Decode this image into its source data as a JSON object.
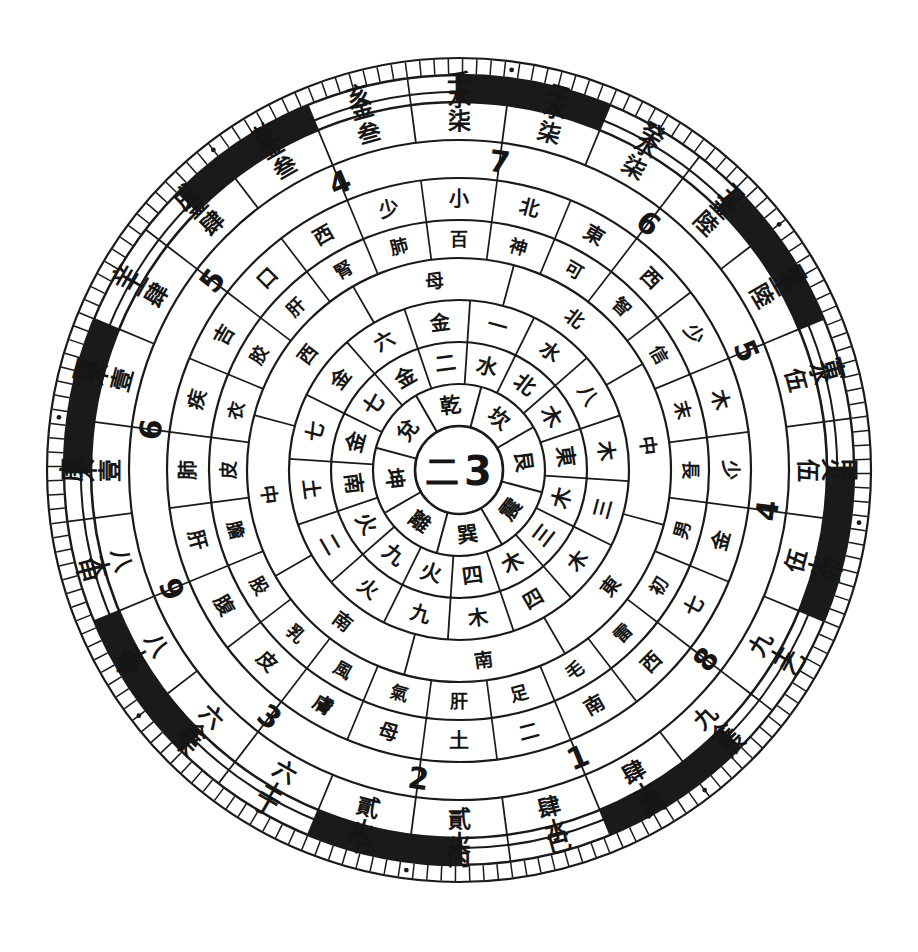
{
  "figure": {
    "kind": "chinese-cosmological-compass-diagram",
    "center_text": [
      "二",
      "3"
    ]
  },
  "geometry": {
    "cx": 459,
    "cy": 470,
    "radii": [
      44,
      86,
      128,
      170,
      212,
      250,
      292,
      330,
      368,
      395,
      412
    ],
    "sectors": 24,
    "start_angle_deg": -97.5
  },
  "colors": {
    "ink": "#1a1a1a",
    "paper": "#ffffff"
  },
  "rings": [
    {
      "name": "ring-trigram-names",
      "count": 8,
      "labels": [
        "坎",
        "艮",
        "震",
        "巽",
        "離",
        "坤",
        "兌",
        "乾"
      ]
    },
    {
      "name": "ring-trigram-element-pairs",
      "count": 16,
      "labels": [
        "水",
        "北",
        "木",
        "東",
        "木",
        "三",
        "木",
        "四",
        "火",
        "九",
        "火",
        "南",
        "金",
        "七",
        "金",
        "二"
      ]
    },
    {
      "name": "ring-element-number",
      "count": 16,
      "labels": [
        "一",
        "水",
        "八",
        "木",
        "三",
        "木",
        "四",
        "木",
        "九",
        "火",
        "二",
        "土",
        "七",
        "金",
        "六",
        "金"
      ]
    },
    {
      "name": "ring-direction-center",
      "count": 8,
      "labels": [
        "北",
        "中",
        "東",
        "南",
        "南",
        "中",
        "西",
        "母"
      ]
    },
    {
      "name": "ring-body-organ",
      "count": 24,
      "labels": [
        "百",
        "神",
        "可",
        "智",
        "信",
        "末",
        "長",
        "男",
        "初",
        "雷",
        "毛",
        "足",
        "肝",
        "氣",
        "風",
        "乳",
        "股",
        "膽",
        "皮",
        "衣",
        "胶",
        "肝",
        "腎",
        "肺"
      ]
    },
    {
      "name": "ring-organ-extra",
      "count": 24,
      "labels": [
        "小",
        "北",
        "東",
        "西",
        "少",
        "木",
        "少",
        "金",
        "七",
        "西",
        "南",
        "二",
        "土",
        "母",
        "膚",
        "皮",
        "腹",
        "肝",
        "肺",
        "疾",
        "吉",
        "口",
        "西",
        "少"
      ]
    },
    {
      "name": "ring-number-arabic",
      "count": 12,
      "labels": [
        "7",
        "6",
        "5",
        "4",
        "8",
        "6",
        "1",
        "2",
        "三",
        "9",
        "伍",
        "一"
      ]
    },
    {
      "name": "ring-numeral-chinese",
      "count": 24,
      "labels": [
        "壹",
        "柒",
        "陸",
        "伍",
        "九",
        "肆",
        "貳",
        "陸",
        "壹",
        "捌",
        "玖",
        "叁"
      ]
    },
    {
      "name": "ring-five-elements",
      "count": 24,
      "labels": [
        "水",
        "水",
        "水",
        "金",
        "金",
        "火",
        "火",
        "土",
        "土",
        "火",
        "火",
        "火",
        "土",
        "火",
        "木",
        "木",
        "木",
        "木",
        "土",
        "金",
        "金",
        "土",
        "金",
        "水"
      ]
    },
    {
      "name": "ring-earthly-branches",
      "count": 24,
      "labels": [
        "壬",
        "子",
        "癸",
        "丑",
        "艮",
        "寅",
        "甲",
        "卯",
        "乙",
        "辰",
        "巽",
        "巳",
        "丙",
        "午",
        "丁",
        "未",
        "坤",
        "申",
        "庚",
        "酉",
        "辛",
        "戌",
        "乾",
        "亥"
      ]
    }
  ],
  "ring_sector_data": {
    "branches_24": [
      "壬",
      "子",
      "癸",
      "丑",
      "艮",
      "寅",
      "甲",
      "卯",
      "乙",
      "辰",
      "巽",
      "巳",
      "丙",
      "午",
      "丁",
      "未",
      "坤",
      "申",
      "庚",
      "酉",
      "辛",
      "戌",
      "乾",
      "亥"
    ],
    "elements_24": [
      "水",
      "水",
      "水",
      "金",
      "土",
      "木",
      "火",
      "火",
      "土",
      "金",
      "木",
      "水",
      "火",
      "火",
      "土",
      "金",
      "木",
      "木",
      "木",
      "木",
      "土",
      "土",
      "金",
      "金"
    ],
    "numerals_24": [
      "柒",
      "柒",
      "柒",
      "陸",
      "陸",
      "伍",
      "伍",
      "伍",
      "九",
      "九",
      "肆",
      "肆",
      "肆",
      "貳",
      "六",
      "六",
      "八",
      "八",
      "壹",
      "壹",
      "肆",
      "肆",
      "叁",
      "叁"
    ],
    "arabic_12": [
      "7",
      "6",
      "5",
      "4",
      "8",
      "1",
      "2",
      "3",
      "9",
      "6",
      "5",
      "4"
    ]
  },
  "ring_labels_flat": {
    "r_branch": [
      "壬",
      "子",
      "癸",
      "丑",
      "艮",
      "寅",
      "甲",
      "卯",
      "乙",
      "辰",
      "巽",
      "巳",
      "丙",
      "午",
      "丁",
      "未",
      "坤",
      "申",
      "庚",
      "酉",
      "辛",
      "戌",
      "乾",
      "亥"
    ],
    "r_elem": [
      "水",
      "水",
      "水",
      "金",
      "土",
      "水",
      "火",
      "火",
      "土",
      "金",
      "木",
      "水",
      "火",
      "火",
      "土",
      "金",
      "木",
      "木",
      "木",
      "木",
      "土",
      "金",
      "金",
      "金"
    ],
    "r_numchar": [
      "柒",
      "柒",
      "柒",
      "陸",
      "陸",
      "伍",
      "伍",
      "伍",
      "九",
      "九",
      "肆",
      "肆",
      "貳",
      "貳",
      "六",
      "六",
      "八",
      "八",
      "壹",
      "壹",
      "肆",
      "肆",
      "叁",
      "叁"
    ],
    "r_arabic": [
      "7",
      "",
      "6",
      "",
      "5",
      "",
      "4",
      "",
      "8",
      "",
      "1",
      "",
      "2",
      ""
    ],
    "r_inner_long": [
      "北斗七星",
      "中天",
      "南極",
      "東方",
      "西方",
      "少陽",
      "少陰",
      "太陽"
    ]
  },
  "outer_band": {
    "tick_count": 180,
    "black_arc_count": 8,
    "dot_count": 8
  }
}
